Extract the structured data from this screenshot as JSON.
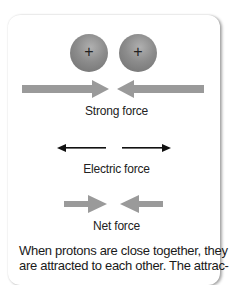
{
  "figure": {
    "particles": [
      {
        "name": "proton",
        "charge_symbol": "+"
      },
      {
        "name": "proton",
        "charge_symbol": "+"
      }
    ],
    "forces": [
      {
        "label": "Strong force",
        "direction": "toward each other",
        "style": "thick gray"
      },
      {
        "label": "Electric force",
        "direction": "away from each other",
        "style": "thin black"
      },
      {
        "label": "Net force",
        "direction": "toward each other",
        "style": "medium gray"
      }
    ],
    "caption": "When protons are close together, they are attracted to each other. The attrac-"
  },
  "colors": {
    "sphere": "#8c8c8c",
    "thick_arrow": "#9a9a9a",
    "thin_arrow": "#111111"
  }
}
